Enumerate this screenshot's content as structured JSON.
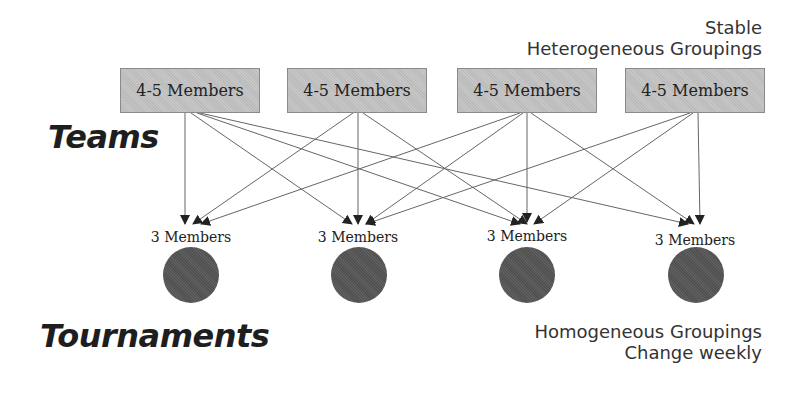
{
  "diagram": {
    "teams_label": "Teams",
    "tournaments_label": "Tournaments",
    "top_note": [
      "Stable",
      "Heterogeneous Groupings"
    ],
    "bottom_note": [
      "Homogeneous Groupings",
      "Change weekly"
    ],
    "teams": [
      {
        "label": "4-5 Members"
      },
      {
        "label": "4-5 Members"
      },
      {
        "label": "4-5 Members"
      },
      {
        "label": "4-5 Members"
      }
    ],
    "tournaments": [
      {
        "label": "3 Members"
      },
      {
        "label": "3 Members"
      },
      {
        "label": "3 Members"
      },
      {
        "label": "3 Members"
      }
    ],
    "edges_note": "Each team sends one arrow to each of the four tournament tables",
    "colors": {
      "team_fill": "#c4c4c4",
      "circle_fill": "#555555",
      "line": "#555555"
    }
  }
}
